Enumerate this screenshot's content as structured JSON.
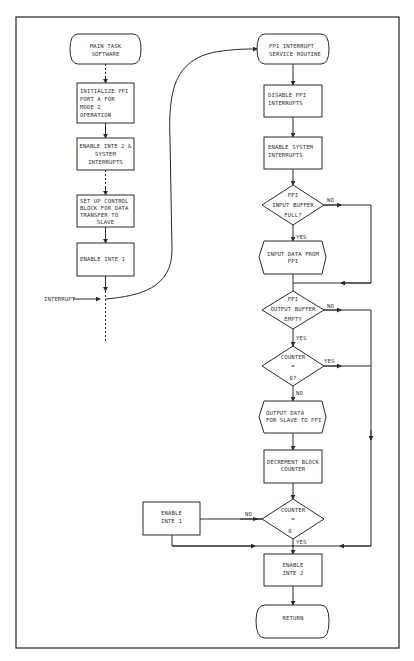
{
  "diagram": {
    "type": "flowchart",
    "left_column": {
      "start": {
        "lines": [
          "MAIN TASK",
          "SOFTWARE"
        ]
      },
      "steps": [
        {
          "lines": [
            "INITIALIZE PPI",
            "PORT A FOR",
            "MODE 2",
            "OPERATION"
          ]
        },
        {
          "lines": [
            "ENABLE INTE 2 &",
            "SYSTEM",
            "INTERRUPTS"
          ]
        },
        {
          "lines": [
            "SET UP CONTROL",
            "BLOCK FOR DATA",
            "TRANSFER TO",
            "SLAVE"
          ]
        },
        {
          "lines": [
            "ENABLE INTE 1"
          ]
        }
      ],
      "interrupt_label": "INTERRUPT"
    },
    "right_column": {
      "start": {
        "lines": [
          "PPI INTERRUPT",
          "SERVICE ROUTINE"
        ]
      },
      "disable": {
        "lines": [
          "DISABLE PPI",
          "INTERRUPTS"
        ]
      },
      "enable_system": {
        "lines": [
          "ENABLE SYSTEM",
          "INTERRUPTS"
        ]
      },
      "decision_input": {
        "lines": [
          "PPI",
          "INPUT BUFFER",
          "FULL?"
        ],
        "no": "NO",
        "yes": "YES"
      },
      "input_data": {
        "lines": [
          "INPUT DATA FROM",
          "PPI"
        ]
      },
      "decision_output": {
        "lines": [
          "PPI",
          "OUTPUT BUFFER",
          "EMPTY"
        ],
        "no": "NO",
        "yes": "YES"
      },
      "decision_counter1": {
        "lines": [
          "COUNTER",
          "=",
          "0?"
        ],
        "yes": "YES",
        "no": "NO"
      },
      "output_data": {
        "lines": [
          "OUTPUT DATA",
          "FOR SLAVE TO PPI"
        ]
      },
      "decrement": {
        "lines": [
          "DECREMENT BLOCK",
          "COUNTER"
        ]
      },
      "decision_counter2": {
        "lines": [
          "COUNTER",
          "=",
          "0"
        ],
        "no": "NO",
        "yes": "YES"
      },
      "enable_inte1": {
        "lines": [
          "ENABLE",
          "INTE 1"
        ]
      },
      "enable_inte2": {
        "lines": [
          "ENABLE",
          "INTE 2"
        ]
      },
      "end": {
        "lines": [
          "RETURN"
        ]
      }
    }
  }
}
